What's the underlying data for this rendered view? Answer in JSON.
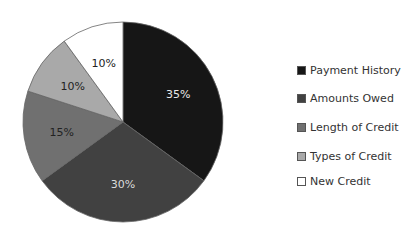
{
  "chart_data": {
    "type": "pie",
    "title": "",
    "categories": [
      "Payment History",
      "Amounts Owed",
      "Length of Credit",
      "Types of Credit",
      "New Credit"
    ],
    "values": [
      35,
      30,
      15,
      10,
      10
    ],
    "labels": [
      "35%",
      "30%",
      "15%",
      "10%",
      "10%"
    ],
    "colors": [
      "#161616",
      "#414141",
      "#707070",
      "#a9a9a9",
      "#ffffff"
    ],
    "legend_position": "right"
  }
}
